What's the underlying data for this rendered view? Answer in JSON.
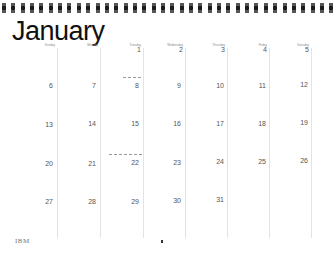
{
  "calendar": {
    "month": "January",
    "day_headers": [
      "Sunday",
      "Monday",
      "Tuesday",
      "Wednesday",
      "Thursday",
      "Friday",
      "Saturday"
    ],
    "weeks": [
      [
        "",
        "",
        "1",
        "2",
        "3",
        "4",
        "5"
      ],
      [
        "6",
        "7",
        "8",
        "9",
        "10",
        "11",
        "12"
      ],
      [
        "13",
        "14",
        "15",
        "16",
        "17",
        "18",
        "19"
      ],
      [
        "20",
        "21",
        "22",
        "23",
        "24",
        "25",
        "26"
      ],
      [
        "27",
        "28",
        "29",
        "30",
        "31",
        "",
        ""
      ]
    ],
    "notes": [
      {
        "day": "8",
        "text": "- - - - -"
      },
      {
        "day": "22",
        "text": "- - - - - - - -"
      }
    ]
  },
  "footer": {
    "brand": "IBM"
  },
  "colors": {
    "ring": "#1a1a1a",
    "grid_line": "#e3e3e3",
    "text": "#555555"
  }
}
